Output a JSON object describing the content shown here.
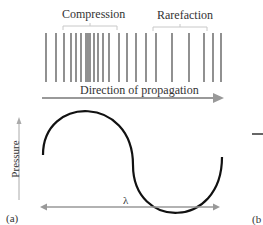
{
  "labels": {
    "compression": "Compression",
    "rarefaction": "Rarefaction",
    "direction": "Direction of propagation",
    "pressure": "Pressure",
    "wavelength": "λ",
    "panel_a": "(a)",
    "panel_b": "(b"
  },
  "wavefront_lines_x": [
    46,
    56,
    64,
    71,
    76,
    81,
    86,
    88,
    90,
    94,
    98,
    103,
    109,
    119,
    127,
    136,
    146,
    156,
    172,
    189,
    204,
    213,
    221
  ],
  "colors": {
    "lines": "#555555",
    "arrow": "#999999",
    "curve": "#111111",
    "text": "#333333"
  }
}
